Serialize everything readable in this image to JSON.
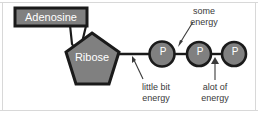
{
  "figure": {
    "name": "ATP molecule diagram",
    "background_color": "#ffffff",
    "border_color": "#d8d8d8",
    "shape_fill": "#808080",
    "shape_stroke": "#1a1a1a",
    "shape_text_color": "#ffffff",
    "annotation_text_color": "#3a3a3a",
    "adenosine": {
      "label": "Adenosine",
      "shape": "callout-box"
    },
    "ribose": {
      "label": "Ribose",
      "shape": "pentagon"
    },
    "phosphates": [
      {
        "label": "P",
        "shape": "circle"
      },
      {
        "label": "P",
        "shape": "circle"
      },
      {
        "label": "P",
        "shape": "circle"
      }
    ],
    "annotations": [
      {
        "id": "some-energy",
        "line1": "some",
        "line2": "energy",
        "points_to": "bond between phosphate 1 and phosphate 2",
        "arrow": "down-left"
      },
      {
        "id": "little-bit-energy",
        "line1": "little bit",
        "line2": "energy",
        "points_to": "bond between ribose and phosphate 1",
        "arrow": "up-left"
      },
      {
        "id": "alot-of-energy",
        "line1": "alot of",
        "line2": "energy",
        "points_to": "bond between phosphate 2 and phosphate 3",
        "arrow": "up"
      }
    ]
  }
}
